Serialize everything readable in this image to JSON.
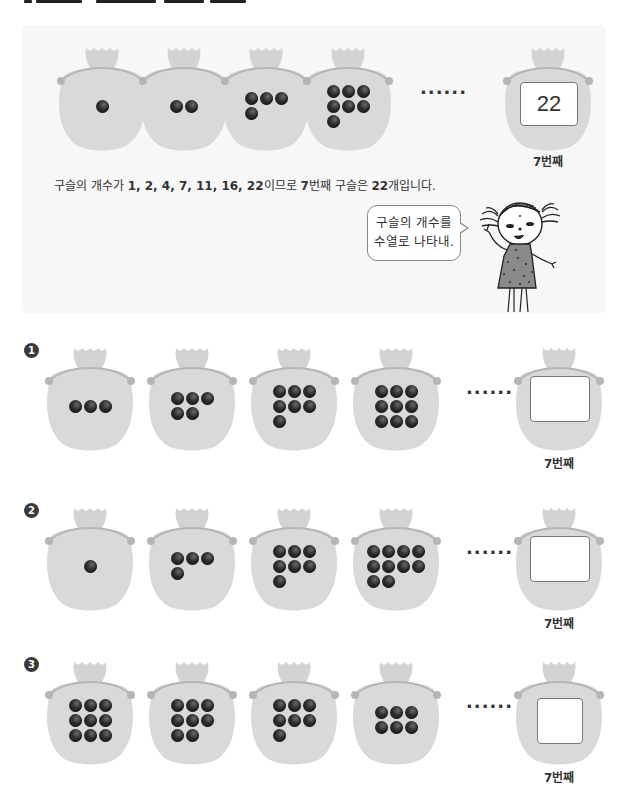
{
  "example": {
    "bags": [
      {
        "count": 1,
        "rows": [
          1
        ]
      },
      {
        "count": 2,
        "rows": [
          2
        ]
      },
      {
        "count": 4,
        "rows": [
          3,
          1
        ]
      },
      {
        "count": 7,
        "rows": [
          3,
          3,
          1
        ]
      }
    ],
    "ellipsis": "······",
    "answer_value": "22",
    "nth_label": "7번째",
    "sentence_parts": {
      "prefix": "구슬의 개수가 ",
      "sequence": "1, 2, 4, 7, 11, 16, 22",
      "middle": "이므로 ",
      "nth": "7",
      "middle2": "번째 구슬은 ",
      "answer": "22",
      "suffix": "개입니다."
    },
    "speech_line1": "구슬의 개수를",
    "speech_line2": "수열로 나타내."
  },
  "problems": [
    {
      "badge": "1",
      "bags": [
        {
          "count": 3,
          "rows": [
            3
          ]
        },
        {
          "count": 5,
          "rows": [
            3,
            2
          ]
        },
        {
          "count": 7,
          "rows": [
            3,
            3,
            1
          ]
        },
        {
          "count": 9,
          "rows": [
            3,
            3,
            3
          ]
        }
      ],
      "ellipsis": "······",
      "answer_value": "",
      "nth_label": "7번째"
    },
    {
      "badge": "2",
      "bags": [
        {
          "count": 1,
          "rows": [
            1
          ]
        },
        {
          "count": 4,
          "rows": [
            3,
            1
          ]
        },
        {
          "count": 7,
          "rows": [
            3,
            3,
            1
          ]
        },
        {
          "count": 10,
          "rows": [
            4,
            4,
            2
          ]
        }
      ],
      "ellipsis": "······",
      "answer_value": "",
      "nth_label": "7번째"
    },
    {
      "badge": "3",
      "bags": [
        {
          "count": 9,
          "rows": [
            3,
            3,
            3
          ]
        },
        {
          "count": 8,
          "rows": [
            3,
            3,
            2
          ]
        },
        {
          "count": 7,
          "rows": [
            3,
            3,
            1
          ]
        },
        {
          "count": 6,
          "rows": [
            3,
            3
          ]
        }
      ],
      "ellipsis": "······",
      "answer_value": "",
      "nth_label": "7번째"
    }
  ],
  "colors": {
    "bag_fill": "#d9d9d9",
    "bag_knot": "#d3d3d3",
    "bag_string": "#b5b5b5",
    "bead": "#2b2b2b",
    "panel_bg": "#f7f7f7"
  }
}
